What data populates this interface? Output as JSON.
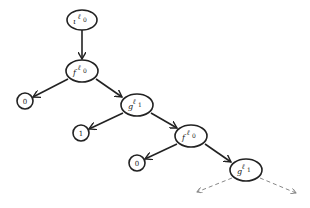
{
  "diagram": {
    "colors": {
      "stroke": "#222222",
      "dashed": "#888888",
      "background": "#ffffff"
    },
    "nodes": [
      {
        "id": "n0",
        "base": "ι",
        "sup": "ℓ",
        "sub": "0",
        "shape": "ellipse",
        "x": 82,
        "y": 20
      },
      {
        "id": "n1",
        "base": "f",
        "sup": "ℓ",
        "sub": "0",
        "shape": "ellipse",
        "x": 82,
        "y": 71
      },
      {
        "id": "n2",
        "text": "0",
        "shape": "circle",
        "x": 25,
        "y": 101
      },
      {
        "id": "n3",
        "base": "g",
        "sup": "ℓ",
        "sub": "1",
        "shape": "ellipse",
        "x": 137,
        "y": 105
      },
      {
        "id": "n4",
        "text": "1",
        "shape": "circle",
        "x": 81,
        "y": 133
      },
      {
        "id": "n5",
        "base": "f",
        "sup": "ℓ",
        "sub": "0",
        "shape": "ellipse",
        "x": 191,
        "y": 136
      },
      {
        "id": "n6",
        "text": "0",
        "shape": "circle",
        "x": 137,
        "y": 163
      },
      {
        "id": "n7",
        "base": "g",
        "sup": "ℓ",
        "sub": "1",
        "shape": "ellipse",
        "x": 246,
        "y": 170
      }
    ],
    "edges": [
      {
        "from": "n0",
        "to": "n1",
        "style": "solid"
      },
      {
        "from": "n1",
        "to": "n2",
        "style": "solid"
      },
      {
        "from": "n1",
        "to": "n3",
        "style": "solid"
      },
      {
        "from": "n3",
        "to": "n4",
        "style": "solid"
      },
      {
        "from": "n3",
        "to": "n5",
        "style": "solid"
      },
      {
        "from": "n5",
        "to": "n6",
        "style": "solid"
      },
      {
        "from": "n5",
        "to": "n7",
        "style": "solid"
      },
      {
        "from": "n7",
        "to": "left-continuation",
        "style": "dashed"
      },
      {
        "from": "n7",
        "to": "right-continuation",
        "style": "dashed"
      }
    ]
  }
}
